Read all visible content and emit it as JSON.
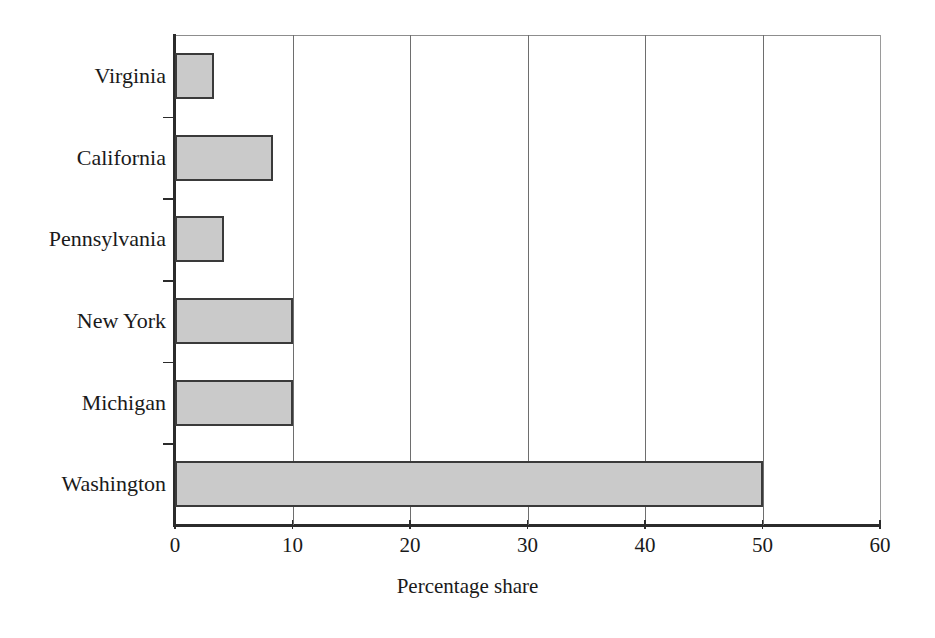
{
  "chart_data": {
    "type": "bar",
    "orientation": "horizontal",
    "title": "",
    "subtitle": "",
    "xlabel": "Percentage share",
    "ylabel": "",
    "categories": [
      "Virginia",
      "California",
      "Pennsylvania",
      "New York",
      "Michigan",
      "Washington"
    ],
    "values": [
      3.3,
      8.3,
      4.2,
      10,
      10,
      50
    ],
    "series": [
      {
        "name": "Percentage share",
        "values": [
          3.3,
          8.3,
          4.2,
          10,
          10,
          50
        ]
      }
    ],
    "xlim": [
      0,
      60
    ],
    "xticks": [
      0,
      10,
      20,
      30,
      40,
      50,
      60
    ],
    "xticklabels": [
      "0",
      "10",
      "20",
      "30",
      "40",
      "50",
      "60"
    ],
    "grid": "vertical",
    "legend": "none",
    "bar_fill_color": "#cacaca",
    "bar_edge_color": "#3a3a3a",
    "background_color": "#ffffff",
    "axis_color": "#2b2b2b",
    "text_color": "#1a1a1a",
    "annotations": []
  }
}
